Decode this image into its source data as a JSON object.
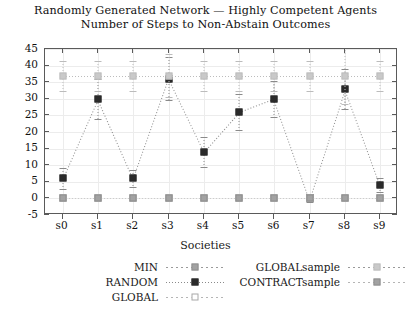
{
  "chart_data": {
    "type": "line",
    "title": "Randomly Generated Network — Highly Competent Agents",
    "subtitle": "Number of Steps to Non-Abstain Outcomes",
    "xlabel": "Societies",
    "ylabel": "",
    "categories": [
      "s0",
      "s1",
      "s2",
      "s3",
      "s4",
      "s5",
      "s6",
      "s7",
      "s8",
      "s9"
    ],
    "ylim": [
      -5,
      45
    ],
    "yticks": [
      -5,
      0,
      5,
      10,
      15,
      20,
      25,
      30,
      35,
      40,
      45
    ],
    "grid": true,
    "legend_position": "bottom",
    "series": [
      {
        "name": "MIN",
        "marker": "filled-square-gray",
        "values": [
          0,
          0,
          0,
          0,
          0,
          0,
          0,
          0,
          0,
          0
        ]
      },
      {
        "name": "RANDOM",
        "marker": "filled-square-dark",
        "values": [
          6,
          30,
          6,
          36,
          14,
          26,
          30,
          0,
          33,
          4
        ],
        "errors": [
          3.2,
          6.0,
          2.6,
          6.5,
          4.5,
          5.5,
          5.5,
          1.2,
          6.0,
          2.0
        ]
      },
      {
        "name": "GLOBAL",
        "marker": "open-square",
        "values": [
          0,
          0,
          0,
          0,
          0,
          0,
          0,
          0,
          0,
          0
        ]
      },
      {
        "name": "GLOBALsample",
        "marker": "filled-square-light",
        "values": [
          37,
          37,
          37,
          37,
          37,
          37,
          37,
          37,
          37,
          37
        ],
        "errors": [
          4.5,
          4.5,
          4.5,
          6.5,
          4.5,
          4.5,
          4.5,
          4.5,
          8.5,
          4.5
        ]
      },
      {
        "name": "CONTRACTsample",
        "marker": "filled-square-gray",
        "values": [
          0,
          0,
          0,
          0,
          0,
          0,
          0,
          0,
          0,
          0
        ]
      }
    ]
  },
  "axis": {
    "x_title": "Societies",
    "y_tick_labels": [
      "45",
      "40",
      "35",
      "30",
      "25",
      "20",
      "15",
      "10",
      "5",
      "0",
      "-5"
    ],
    "x_tick_labels": [
      "s0",
      "s1",
      "s2",
      "s3",
      "s4",
      "s5",
      "s6",
      "s7",
      "s8",
      "s9"
    ]
  },
  "legend": {
    "col1": [
      {
        "label": "MIN"
      },
      {
        "label": "RANDOM"
      },
      {
        "label": "GLOBAL"
      }
    ],
    "col2": [
      {
        "label": "GLOBALsample"
      },
      {
        "label": "CONTRACTsample"
      }
    ]
  }
}
